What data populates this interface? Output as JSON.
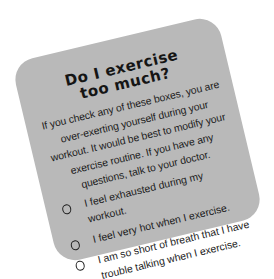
{
  "card": {
    "title_line1": "Do I exercise",
    "title_line2": "too much?",
    "intro": "If you check any of these boxes, you are over-exerting yourself during your workout. It would be best to modify your exercise routine. If you have any questions, talk to your doctor.",
    "items": [
      {
        "label": "I feel exhausted during my workout.",
        "checked": false
      },
      {
        "label": "I feel very hot when I exercise.",
        "checked": false
      },
      {
        "label": "I am so short of breath that I have trouble talking when I exercise.",
        "checked": false
      }
    ],
    "colors": {
      "card": "#b9b9b9",
      "text": "#1c1c1c",
      "background": "#ffffff"
    }
  }
}
